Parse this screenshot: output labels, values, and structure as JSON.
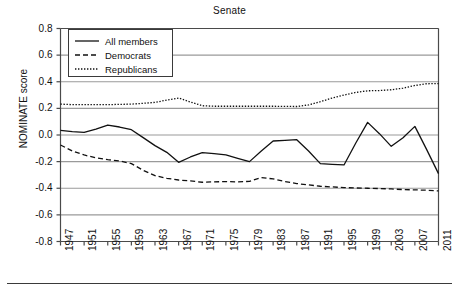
{
  "figure": {
    "title": "Senate",
    "bottom_rule": true
  },
  "axes": {
    "ylabel": "NOMINATE score",
    "xlabel": "",
    "yticks": [
      "0.8",
      "0.6",
      "0.4",
      "0.2",
      "0.0",
      "-0.2",
      "-0.4",
      "-0.6",
      "-0.8"
    ],
    "ytick_values": [
      0.8,
      0.6,
      0.4,
      0.2,
      0.0,
      -0.2,
      -0.4,
      -0.6,
      -0.8
    ],
    "xticks": [
      "1947",
      "1951",
      "1955",
      "1959",
      "1963",
      "1967",
      "1971",
      "1975",
      "1979",
      "1983",
      "1987",
      "1991",
      "1995",
      "1999",
      "2003",
      "2007",
      "2011"
    ],
    "xtick_values": [
      1947,
      1951,
      1955,
      1959,
      1963,
      1967,
      1971,
      1975,
      1979,
      1983,
      1987,
      1991,
      1995,
      1999,
      2003,
      2007,
      2011
    ],
    "grid": "horizontal",
    "ylim": [
      -0.8,
      0.8
    ],
    "xlim": [
      1947,
      2011
    ]
  },
  "legend": {
    "position": "upper-left-inside",
    "entries": [
      {
        "label": "All members",
        "style": "solid"
      },
      {
        "label": "Democrats",
        "style": "dashed"
      },
      {
        "label": "Republicans",
        "style": "dotted"
      }
    ]
  },
  "colors": {
    "line": "#111111",
    "grid": "#9a9a9a",
    "axis": "#4a4a4a",
    "background": "#ffffff"
  },
  "chart_data": {
    "type": "line",
    "title": "Senate",
    "xlabel": "",
    "ylabel": "NOMINATE score",
    "ylim": [
      -0.8,
      0.8
    ],
    "xlim": [
      1947,
      2011
    ],
    "grid": true,
    "legend_position": "upper left",
    "x": [
      1947,
      1949,
      1951,
      1953,
      1955,
      1957,
      1959,
      1961,
      1963,
      1965,
      1967,
      1969,
      1971,
      1973,
      1975,
      1977,
      1979,
      1981,
      1983,
      1985,
      1987,
      1989,
      1991,
      1993,
      1995,
      1997,
      1999,
      2001,
      2003,
      2005,
      2007,
      2009,
      2011
    ],
    "series": [
      {
        "name": "All members",
        "style": "solid",
        "values": [
          0.035,
          0.025,
          0.02,
          0.045,
          0.075,
          0.06,
          0.04,
          -0.02,
          -0.08,
          -0.13,
          -0.205,
          -0.165,
          -0.132,
          -0.14,
          -0.15,
          -0.175,
          -0.2,
          -0.12,
          -0.045,
          -0.04,
          -0.035,
          -0.12,
          -0.215,
          -0.22,
          -0.225,
          -0.06,
          0.095,
          0.01,
          -0.085,
          -0.02,
          0.065,
          -0.11,
          -0.29
        ]
      },
      {
        "name": "Democrats",
        "style": "dashed",
        "values": [
          -0.075,
          -0.12,
          -0.15,
          -0.172,
          -0.185,
          -0.195,
          -0.215,
          -0.265,
          -0.305,
          -0.325,
          -0.338,
          -0.345,
          -0.355,
          -0.352,
          -0.35,
          -0.352,
          -0.348,
          -0.32,
          -0.33,
          -0.35,
          -0.365,
          -0.375,
          -0.385,
          -0.39,
          -0.395,
          -0.398,
          -0.4,
          -0.402,
          -0.405,
          -0.41,
          -0.412,
          -0.415,
          -0.42
        ]
      },
      {
        "name": "Republicans",
        "style": "dotted",
        "values": [
          0.232,
          0.228,
          0.228,
          0.228,
          0.228,
          0.23,
          0.232,
          0.238,
          0.245,
          0.262,
          0.278,
          0.248,
          0.22,
          0.216,
          0.216,
          0.216,
          0.216,
          0.216,
          0.216,
          0.215,
          0.214,
          0.226,
          0.25,
          0.278,
          0.3,
          0.32,
          0.332,
          0.334,
          0.34,
          0.352,
          0.372,
          0.385,
          0.386
        ]
      }
    ]
  }
}
